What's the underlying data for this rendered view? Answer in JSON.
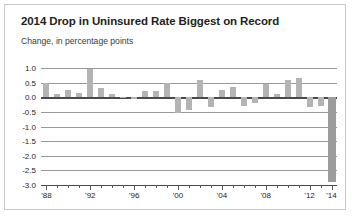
{
  "card": {
    "title": "2014 Drop in Uninsured Rate Biggest on Record",
    "subtitle": "Change, in percentage points"
  },
  "chart_data": {
    "type": "bar",
    "title": "2014 Drop in Uninsured Rate Biggest on Record",
    "subtitle": "Change, in percentage points",
    "xlabel": "",
    "ylabel": "Change, in percentage points",
    "ylim": [
      -3.0,
      1.0
    ],
    "ytick_labels": [
      "1.0",
      "0.5",
      "0.0",
      "-0.5",
      "-1.0",
      "-1.5",
      "-2.0",
      "-2.5",
      "-3.0"
    ],
    "ytick_values": [
      1.0,
      0.5,
      0.0,
      -0.5,
      -1.0,
      -1.5,
      -2.0,
      -2.5,
      -3.0
    ],
    "grid": true,
    "legend": "none",
    "xtick_labels": [
      "'88",
      "'92",
      "'96",
      "'00",
      "'04",
      "'08",
      "'12",
      "'14"
    ],
    "xtick_values": [
      1988,
      1992,
      1996,
      2000,
      2004,
      2008,
      2012,
      2014
    ],
    "categories": [
      1988,
      1989,
      1990,
      1991,
      1992,
      1993,
      1994,
      1995,
      1996,
      1997,
      1998,
      1999,
      2000,
      2001,
      2002,
      2003,
      2004,
      2005,
      2006,
      2007,
      2008,
      2009,
      2010,
      2011,
      2012,
      2013,
      2014
    ],
    "values": [
      0.5,
      0.1,
      0.25,
      0.15,
      0.95,
      0.3,
      0.1,
      0.0,
      -0.05,
      0.2,
      0.2,
      0.5,
      -0.55,
      -0.45,
      0.6,
      -0.35,
      0.25,
      0.35,
      -0.3,
      -0.2,
      0.45,
      0.1,
      0.6,
      0.65,
      -0.35,
      -0.3,
      -2.9
    ],
    "highlight_category": 2014,
    "highlight_value": -2.9,
    "bar_color": "#b4b4b4",
    "highlight_color": "#9c9c9c"
  }
}
